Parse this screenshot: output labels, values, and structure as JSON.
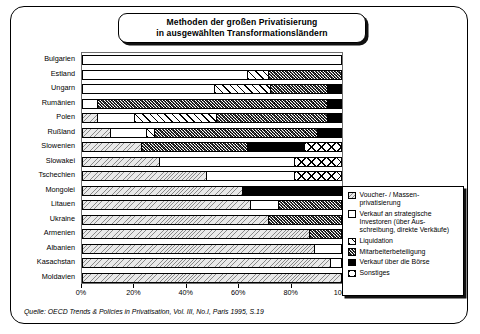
{
  "title": {
    "line1": "Methoden der großen Privatisierung",
    "line2": "in ausgewählten Transformationsländern"
  },
  "source": "Quelle: OECD Trends & Policies in Privatisation, Vol. III, No.I, Paris 1995, S.19",
  "legend": {
    "items": [
      {
        "key": "voucher",
        "label": "Voucher- / Massen-\nprivatisierung",
        "swatch": "p-voucher"
      },
      {
        "key": "strategic",
        "label": "Verkauf an strategische\nInvestoren (über Aus-\nschreibung, direkte Verkäufe)",
        "swatch": "p-strategic"
      },
      {
        "key": "liquidation",
        "label": "Liquidation",
        "swatch": "p-liquid"
      },
      {
        "key": "employee",
        "label": "Mitarbeiterbeteiligung",
        "swatch": "p-employee"
      },
      {
        "key": "boerse",
        "label": "Verkauf über die Börse",
        "swatch": "p-boerse"
      },
      {
        "key": "sonstiges",
        "label": "Sonstiges",
        "swatch": "p-sonstiges"
      }
    ]
  },
  "chart_data": {
    "type": "bar",
    "orientation": "horizontal",
    "stacked": true,
    "normalized_percent": true,
    "title": "Methoden der großen Privatisierung in ausgewählten Transformationsländern",
    "xlabel": "",
    "ylabel": "",
    "xlim": [
      0,
      100
    ],
    "xticks": [
      0,
      20,
      40,
      60,
      80,
      100
    ],
    "xticklabels": [
      "0%",
      "20%",
      "40%",
      "60%",
      "80%",
      "100%"
    ],
    "grid": false,
    "legend_position": "right-inside",
    "series": [
      {
        "name": "Voucher- / Massenprivatisierung",
        "key": "voucher"
      },
      {
        "name": "Verkauf an strategische Investoren (über Ausschreibung, direkte Verkäufe)",
        "key": "strategic"
      },
      {
        "name": "Liquidation",
        "key": "liquidation"
      },
      {
        "name": "Mitarbeiterbeteiligung",
        "key": "employee"
      },
      {
        "name": "Verkauf über die Börse",
        "key": "boerse"
      },
      {
        "name": "Sonstiges",
        "key": "sonstiges"
      }
    ],
    "categories": [
      "Bulgarien",
      "Estland",
      "Ungarn",
      "Rumänien",
      "Polen",
      "Rußland",
      "Slowenien",
      "Slowakei",
      "Tschechien",
      "Mongolei",
      "Litauen",
      "Ukraine",
      "Armenien",
      "Albanien",
      "Kasachstan",
      "Moldavien"
    ],
    "rows": [
      {
        "country": "Bulgarien",
        "segments": [
          {
            "key": "strategic",
            "value": 100
          }
        ]
      },
      {
        "country": "Estland",
        "segments": [
          {
            "key": "strategic",
            "value": 64
          },
          {
            "key": "liquidation",
            "value": 8
          },
          {
            "key": "employee",
            "value": 28
          }
        ]
      },
      {
        "country": "Ungarn",
        "segments": [
          {
            "key": "strategic",
            "value": 51
          },
          {
            "key": "liquidation",
            "value": 22
          },
          {
            "key": "employee",
            "value": 22
          },
          {
            "key": "boerse",
            "value": 5
          }
        ]
      },
      {
        "country": "Rumänien",
        "segments": [
          {
            "key": "strategic",
            "value": 6
          },
          {
            "key": "employee",
            "value": 89
          },
          {
            "key": "boerse",
            "value": 5
          }
        ]
      },
      {
        "country": "Polen",
        "segments": [
          {
            "key": "voucher",
            "value": 6
          },
          {
            "key": "strategic",
            "value": 14
          },
          {
            "key": "liquidation",
            "value": 32
          },
          {
            "key": "employee",
            "value": 43
          },
          {
            "key": "boerse",
            "value": 5
          }
        ]
      },
      {
        "country": "Rußland",
        "segments": [
          {
            "key": "voucher",
            "value": 11
          },
          {
            "key": "strategic",
            "value": 14
          },
          {
            "key": "liquidation",
            "value": 3
          },
          {
            "key": "employee",
            "value": 63
          },
          {
            "key": "boerse",
            "value": 9
          }
        ]
      },
      {
        "country": "Slowenien",
        "segments": [
          {
            "key": "voucher",
            "value": 23
          },
          {
            "key": "employee",
            "value": 41
          },
          {
            "key": "boerse",
            "value": 22
          },
          {
            "key": "sonstiges",
            "value": 14
          }
        ]
      },
      {
        "country": "Slowakei",
        "segments": [
          {
            "key": "voucher",
            "value": 30
          },
          {
            "key": "strategic",
            "value": 52
          },
          {
            "key": "sonstiges",
            "value": 18
          }
        ]
      },
      {
        "country": "Tschechien",
        "segments": [
          {
            "key": "voucher",
            "value": 48
          },
          {
            "key": "strategic",
            "value": 34
          },
          {
            "key": "sonstiges",
            "value": 18
          }
        ]
      },
      {
        "country": "Mongolei",
        "segments": [
          {
            "key": "voucher",
            "value": 62
          },
          {
            "key": "boerse",
            "value": 38
          }
        ]
      },
      {
        "country": "Litauen",
        "segments": [
          {
            "key": "voucher",
            "value": 65
          },
          {
            "key": "strategic",
            "value": 11
          },
          {
            "key": "employee",
            "value": 24
          }
        ]
      },
      {
        "country": "Ukraine",
        "segments": [
          {
            "key": "voucher",
            "value": 72
          },
          {
            "key": "employee",
            "value": 28
          }
        ]
      },
      {
        "country": "Armenien",
        "segments": [
          {
            "key": "voucher",
            "value": 88
          },
          {
            "key": "employee",
            "value": 12
          }
        ]
      },
      {
        "country": "Albanien",
        "segments": [
          {
            "key": "voucher",
            "value": 90
          },
          {
            "key": "strategic",
            "value": 10
          }
        ]
      },
      {
        "country": "Kasachstan",
        "segments": [
          {
            "key": "voucher",
            "value": 96
          },
          {
            "key": "strategic",
            "value": 4
          }
        ]
      },
      {
        "country": "Moldavien",
        "segments": [
          {
            "key": "voucher",
            "value": 100
          }
        ]
      }
    ]
  }
}
